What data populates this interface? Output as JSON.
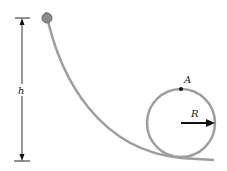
{
  "diagram": {
    "labels": {
      "height": "h",
      "point": "A",
      "radius": "R"
    },
    "colors": {
      "track": "#9e9e9e",
      "ball": "#8a8a8a",
      "arrow": "#111111",
      "background": "#ffffff"
    }
  }
}
